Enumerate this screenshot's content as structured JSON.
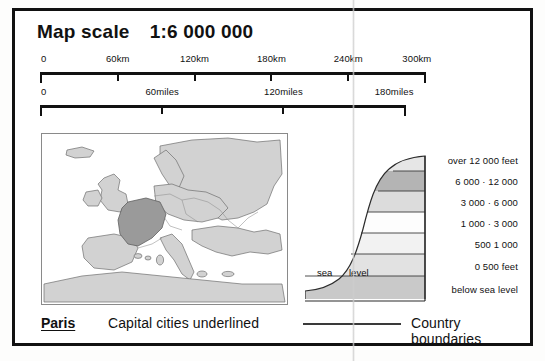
{
  "panel": {
    "title_label": "Map scale",
    "scale_ratio": "1:6 000 000"
  },
  "scale_bars": [
    {
      "id": "km",
      "unit": "km",
      "ticks": [
        {
          "label": "0",
          "value": 0,
          "pos_pct": 0
        },
        {
          "label": "60km",
          "value": 60,
          "pos_pct": 20
        },
        {
          "label": "120km",
          "value": 120,
          "pos_pct": 40
        },
        {
          "label": "180km",
          "value": 180,
          "pos_pct": 60
        },
        {
          "label": "240km",
          "value": 240,
          "pos_pct": 80
        },
        {
          "label": "300km",
          "value": 300,
          "pos_pct": 100
        }
      ]
    },
    {
      "id": "miles",
      "unit": "miles",
      "ticks": [
        {
          "label": "0",
          "value": 0,
          "pos_pct": 0
        },
        {
          "label": "60miles",
          "value": 60,
          "pos_pct": 33.3
        },
        {
          "label": "120miles",
          "value": 120,
          "pos_pct": 66.6
        },
        {
          "label": "180miles",
          "value": 180,
          "pos_pct": 100
        }
      ]
    }
  ],
  "inset_map": {
    "name": "europe-locator-map",
    "highlighted_country": "France",
    "sea_color": "#ffffff",
    "land_color": "#d2d2d2",
    "highlight_color": "#9a9a9a",
    "outline_color": "#6f6f6f"
  },
  "relief_key": {
    "sea_level_label_left": "sea",
    "sea_level_label_right": "level",
    "bands": [
      {
        "label": "over 12 000 feet",
        "color": "#e6e6e6"
      },
      {
        "label": "6 000 · 12 000",
        "color": "#b4b4b4"
      },
      {
        "label": "3 000 · 6 000",
        "color": "#dcdcdc"
      },
      {
        "label": "1 000 · 3 000",
        "color": "#fdfdfd"
      },
      {
        "label": "500  1 000",
        "color": "#f2f2f2"
      },
      {
        "label": "0   500 feet",
        "color": "#e2e2e2"
      },
      {
        "label": "below sea level",
        "color": "#c9c9c9"
      }
    ]
  },
  "legend_row": {
    "capital_sample": "Paris",
    "capital_description": "Capital cities underlined",
    "boundary_description": "Country boundaries",
    "boundary_line_color": "#3a3a3a"
  }
}
